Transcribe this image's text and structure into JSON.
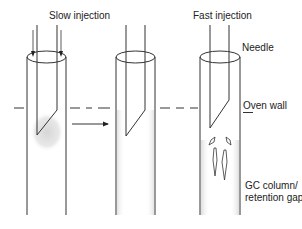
{
  "diagram": {
    "panels": [
      {
        "id": "slow",
        "title": "Slow injection"
      },
      {
        "id": "middle",
        "title": ""
      },
      {
        "id": "fast",
        "title": "Fast injection"
      }
    ],
    "labels": {
      "slow_injection": "Slow injection",
      "fast_injection": "Fast injection",
      "needle": "Needle",
      "oven_wall": "Oven wall",
      "gc_column_line1": "GC column/",
      "gc_column_line2": "retention gap"
    },
    "colors": {
      "line": "#333333",
      "shading": "#d9d9d9",
      "background": "#ffffff"
    }
  }
}
